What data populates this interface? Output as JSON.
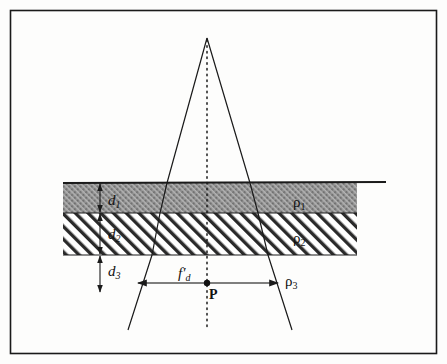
{
  "figure": {
    "background_color": "#fdfdfc",
    "border_color": "#1a1a1a",
    "ink_color": "#1a1a1a"
  },
  "layers": [
    {
      "name": "layer-1",
      "fill": "#9a9a9a",
      "pattern": "stipple-crosshatch",
      "thickness_label": "d",
      "thickness_sub": "1",
      "resistivity_label": "ρ",
      "resistivity_sub": "1"
    },
    {
      "name": "layer-2",
      "fill": "#ffffff",
      "pattern": "diagonal-hatch",
      "thickness_label": "d",
      "thickness_sub": "2",
      "resistivity_label": "ρ",
      "resistivity_sub": "2"
    },
    {
      "name": "layer-3",
      "fill": "#ffffff",
      "pattern": "none",
      "thickness_label": "d",
      "thickness_sub": "3",
      "resistivity_label": "ρ",
      "resistivity_sub": "3"
    }
  ],
  "labels": {
    "d1": {
      "base": "d",
      "sub": "1"
    },
    "d2": {
      "base": "d",
      "sub": "2"
    },
    "d3": {
      "base": "d",
      "sub": "3"
    },
    "rho1": {
      "base": "ρ",
      "sub": "1"
    },
    "rho2": {
      "base": "ρ",
      "sub": "2"
    },
    "rho3": {
      "base": "ρ",
      "sub": "3"
    },
    "focal": {
      "base": "f",
      "prime": "′",
      "sub": "d"
    },
    "point": {
      "base": "P"
    }
  },
  "annotations": {
    "center_axis": "dotted-vertical-axis",
    "span_arrow": "horizontal-double-arrow",
    "thickness_arrows": "vertical-double-arrows",
    "focus_point": "P"
  }
}
